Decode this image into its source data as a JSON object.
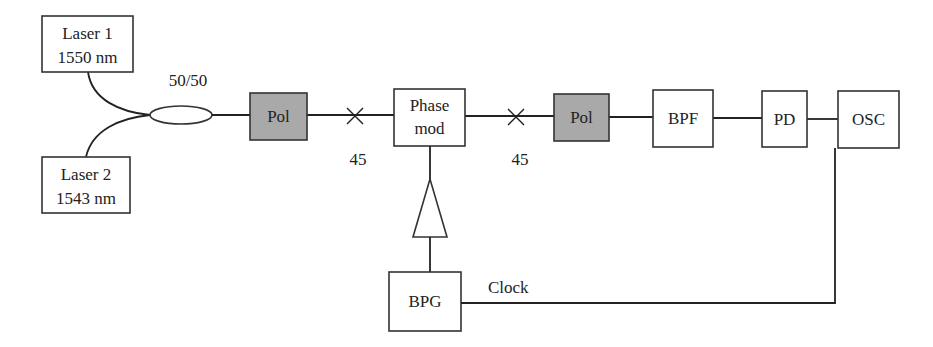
{
  "diagram": {
    "type": "optical-setup-block-diagram",
    "components": {
      "laser1": {
        "line1": "Laser 1",
        "line2": "1550 nm"
      },
      "laser2": {
        "line1": "Laser 2",
        "line2": "1543 nm"
      },
      "coupler": {
        "label": "50/50"
      },
      "pol1": {
        "label": "Pol"
      },
      "angle1": {
        "label": "45"
      },
      "phase_mod": {
        "line1": "Phase",
        "line2": "mod"
      },
      "angle2": {
        "label": "45"
      },
      "pol2": {
        "label": "Pol"
      },
      "bpf": {
        "label": "BPF"
      },
      "pd": {
        "label": "PD"
      },
      "osc": {
        "label": "OSC"
      },
      "bpg": {
        "label": "BPG"
      },
      "clock": {
        "label": "Clock"
      }
    },
    "connections": [
      [
        "Laser 1",
        "50/50 coupler"
      ],
      [
        "Laser 2",
        "50/50 coupler"
      ],
      [
        "50/50 coupler",
        "Pol"
      ],
      [
        "Pol",
        "45° splice"
      ],
      [
        "45° splice",
        "Phase mod"
      ],
      [
        "Phase mod",
        "45° splice"
      ],
      [
        "45° splice",
        "Pol"
      ],
      [
        "Pol",
        "BPF"
      ],
      [
        "BPF",
        "PD"
      ],
      [
        "PD",
        "OSC"
      ],
      [
        "BPG",
        "Amplifier"
      ],
      [
        "Amplifier",
        "Phase mod"
      ],
      [
        "BPG",
        "OSC (Clock)"
      ]
    ],
    "colors": {
      "polarizer_fill": "#a9a9a9",
      "line": "#222222",
      "background": "#ffffff"
    }
  }
}
